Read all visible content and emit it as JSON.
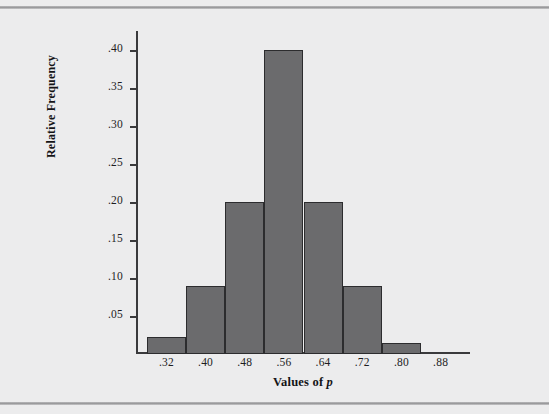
{
  "chart_data": {
    "type": "bar",
    "title": "",
    "subtitle": "",
    "xlabel": "Values of p",
    "xlabel_plain": "Values of",
    "xlabel_italic": "p",
    "ylabel": "Relative Frequency",
    "categories": [
      ".32",
      ".40",
      ".48",
      ".56",
      ".64",
      ".72",
      ".80",
      ".88"
    ],
    "bin_edges": [
      0.28,
      0.36,
      0.44,
      0.52,
      0.6,
      0.68,
      0.76,
      0.84,
      0.92
    ],
    "bin_centers": [
      0.32,
      0.4,
      0.48,
      0.56,
      0.64,
      0.72,
      0.8,
      0.88
    ],
    "values": [
      0.023,
      0.09,
      0.2,
      0.4,
      0.2,
      0.09,
      0.015,
      0.0
    ],
    "bars": [
      {
        "label": ".32",
        "center": 0.32,
        "left": 0.28,
        "right": 0.36,
        "value": 0.023
      },
      {
        "label": ".40",
        "center": 0.4,
        "left": 0.36,
        "right": 0.44,
        "value": 0.09
      },
      {
        "label": ".48",
        "center": 0.48,
        "left": 0.44,
        "right": 0.52,
        "value": 0.2
      },
      {
        "label": ".56",
        "center": 0.56,
        "left": 0.52,
        "right": 0.6,
        "value": 0.4
      },
      {
        "label": ".64",
        "center": 0.64,
        "left": 0.6,
        "right": 0.68,
        "value": 0.2
      },
      {
        "label": ".72",
        "center": 0.72,
        "left": 0.68,
        "right": 0.76,
        "value": 0.09
      },
      {
        "label": ".80",
        "center": 0.8,
        "left": 0.76,
        "right": 0.84,
        "value": 0.015
      }
    ],
    "ytick_labels": [
      ".05",
      ".10",
      ".15",
      ".20",
      ".25",
      ".30",
      ".35",
      ".40"
    ],
    "ytick_values": [
      0.05,
      0.1,
      0.15,
      0.2,
      0.25,
      0.3,
      0.35,
      0.4
    ],
    "xtick_labels": [
      ".32",
      ".40",
      ".48",
      ".56",
      ".64",
      ".72",
      ".80",
      ".88"
    ],
    "xtick_values": [
      0.32,
      0.4,
      0.48,
      0.56,
      0.64,
      0.72,
      0.8,
      0.88
    ],
    "ylim": [
      0.0,
      0.425
    ],
    "xlim": [
      0.26,
      0.94
    ],
    "grid": false,
    "legend": null,
    "colors": {
      "bar_fill": "#6b6b6d",
      "bar_edge": "#2c2c2e",
      "axis": "#3a3a3c",
      "background": "#ececed",
      "text": "#1d1d1f",
      "rule": "#9a9a9c"
    }
  }
}
